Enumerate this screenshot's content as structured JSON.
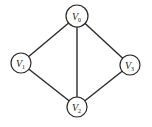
{
  "diagram": {
    "type": "undirected-graph",
    "nodes": [
      {
        "id": "v0",
        "letter": "V",
        "sub": "0",
        "x": 77,
        "y": 16,
        "r": 11
      },
      {
        "id": "v1",
        "letter": "V",
        "sub": "1",
        "x": 21,
        "y": 63,
        "r": 10
      },
      {
        "id": "v3",
        "letter": "V",
        "sub": "3",
        "x": 130,
        "y": 65,
        "r": 10
      },
      {
        "id": "v2",
        "letter": "V",
        "sub": "2",
        "x": 77,
        "y": 107,
        "r": 10
      }
    ],
    "edges": [
      {
        "from": "v0",
        "to": "v1"
      },
      {
        "from": "v0",
        "to": "v2"
      },
      {
        "from": "v0",
        "to": "v3"
      },
      {
        "from": "v1",
        "to": "v2"
      },
      {
        "from": "v3",
        "to": "v2"
      }
    ]
  }
}
